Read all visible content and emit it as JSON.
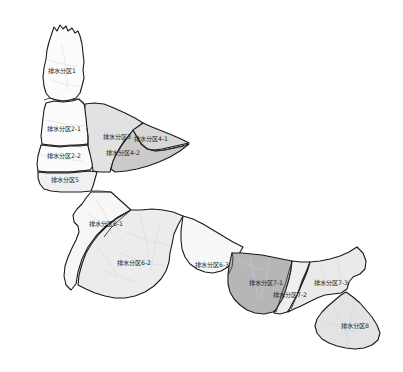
{
  "map": {
    "title": "排水分区划分图",
    "background_color": "#ffffff",
    "outline_color": "#1a1a1a",
    "street_color": "#cfcfcf",
    "label_color": "#1c1c1c",
    "zones": [
      {
        "id": "zone-1",
        "label": "排水分区1",
        "fill": "#fcfcfc",
        "label_x": 62,
        "label_y": 71,
        "path": "M 52 33 L 54 27 L 57 31 L 60 25 L 63 29 L 66 26 L 68 31 L 72 28 L 75 33 L 78 31 L 80 36 L 82 44 L 83 53 L 84 62 L 83 70 L 84 78 L 82 86 L 80 93 L 76 98 L 70 100 L 63 101 L 56 100 L 50 98 L 46 93 L 44 86 L 43 77 L 44 68 L 46 59 L 47 50 L 49 42 Z"
      },
      {
        "id": "zone-2-1",
        "label": "排水分区2-1",
        "fill": "#fbfbfb",
        "label_x": 64,
        "label_y": 129,
        "path": "M 46 103 L 54 101 L 63 102 L 72 101 L 79 99 L 84 104 L 86 111 L 87 120 L 88 129 L 89 138 L 88 144 L 78 145 L 68 146 L 58 146 L 48 145 L 42 144 L 41 136 L 42 127 L 43 118 L 44 110 Z"
      },
      {
        "id": "zone-2-2",
        "label": "排水分区2-2",
        "fill": "#fbfbfb",
        "label_x": 64,
        "label_y": 156,
        "path": "M 41 145 L 50 146 L 60 147 L 70 146 L 80 146 L 88 145 L 90 152 L 92 159 L 93 166 L 90 170 L 80 171 L 69 172 L 58 172 L 47 172 L 38 171 L 37 164 L 38 156 Z"
      },
      {
        "id": "zone-3",
        "label": "排水分区3",
        "fill": "#e2e2e2",
        "label_x": 117,
        "label_y": 137,
        "path": "M 85 104 L 94 103 L 104 104 L 114 108 L 125 113 L 135 118 L 143 123 L 137 128 L 130 134 L 124 141 L 119 149 L 115 157 L 112 165 L 110 172 L 100 172 L 93 171 L 92 163 L 90 154 L 88 146 L 88 137 L 87 128 L 86 118 L 85 110 Z"
      },
      {
        "id": "zone-4-1",
        "label": "排水分区4-1",
        "fill": "#d8d8d8",
        "label_x": 151,
        "label_y": 139,
        "path": "M 143 123 L 152 127 L 162 131 L 172 135 L 181 139 L 189 143 L 180 145 L 171 147 L 162 149 L 154 150 L 147 149 L 142 146 L 138 141 L 134 136 L 133 130 Z"
      },
      {
        "id": "zone-4-2",
        "label": "排水分区4-2",
        "fill": "#cacaca",
        "label_x": 123,
        "label_y": 153,
        "path": "M 133 130 L 137 137 L 141 144 L 147 149 L 155 151 L 164 150 L 173 148 L 182 146 L 189 144 L 180 151 L 170 157 L 159 162 L 148 166 L 137 169 L 126 171 L 115 172 L 111 169 L 113 161 L 117 153 L 122 145 L 128 137 Z"
      },
      {
        "id": "zone-5",
        "label": "排水分区5",
        "fill": "#f0f0f0",
        "label_x": 65,
        "label_y": 180,
        "path": "M 38 172 L 48 173 L 58 173 L 69 173 L 80 172 L 90 171 L 97 172 L 95 179 L 93 186 L 91 191 L 81 192 L 71 192 L 61 192 L 51 191 L 44 189 L 40 184 L 38 178 Z"
      },
      {
        "id": "zone-6-1",
        "label": "排水分区6-1",
        "fill": "#f7f7f7",
        "label_x": 106,
        "label_y": 224,
        "path": "M 91 192 L 101 192 L 111 192 L 121 201 L 131 210 L 118 217 L 106 226 L 96 236 L 88 247 L 82 259 L 78 272 L 76 284 L 71 290 L 66 285 L 64 276 L 65 266 L 68 257 L 72 248 L 76 240 L 79 232 L 78 226 L 74 222 L 73 215 L 77 209 L 82 204 L 86 198 Z"
      },
      {
        "id": "zone-6-2",
        "label": "排水分区6-2",
        "fill": "#ececec",
        "label_x": 134,
        "label_y": 263,
        "path": "M 131 210 L 141 210 L 152 209 L 163 210 L 173 212 L 183 216 L 178 225 L 174 234 L 172 244 L 170 253 L 169 262 L 166 271 L 161 279 L 154 286 L 145 292 L 135 296 L 125 298 L 115 298 L 105 296 L 95 293 L 86 289 L 78 285 L 79 275 L 82 264 L 86 253 L 92 243 L 99 234 L 107 226 L 116 219 Z"
      },
      {
        "id": "zone-6-3",
        "label": "排水分区6-3",
        "fill": "#f7f7f7",
        "label_x": 212,
        "label_y": 265,
        "path": "M 183 216 L 193 219 L 203 224 L 213 230 L 223 236 L 233 242 L 243 247 L 239 254 L 234 261 L 228 267 L 221 271 L 213 273 L 205 272 L 197 269 L 190 264 L 185 257 L 182 249 L 181 240 L 181 231 L 182 223 Z"
      },
      {
        "id": "zone-7-1",
        "label": "排水分区7-1",
        "fill": "#b6b6b6",
        "label_x": 266,
        "label_y": 283,
        "path": "M 232 253 L 242 253 L 252 254 L 262 255 L 272 257 L 282 259 L 292 261 L 291 270 L 289 280 L 287 290 L 284 299 L 280 307 L 273 312 L 264 314 L 255 313 L 247 310 L 240 305 L 234 299 L 230 292 L 228 284 L 228 275 L 229 266 Z"
      },
      {
        "id": "zone-7-2",
        "label": "排水分区7-2",
        "fill": "#efefef",
        "label_x": 290,
        "label_y": 295,
        "path": "M 292 261 L 301 262 L 310 262 L 306 272 L 302 281 L 299 290 L 296 299 L 292 307 L 287 312 L 280 314 L 274 313 L 278 306 L 283 298 L 286 289 L 289 279 L 291 270 Z"
      },
      {
        "id": "zone-7-3",
        "label": "排水分区7-3",
        "fill": "#eaeaea",
        "label_x": 331,
        "label_y": 283,
        "path": "M 310 262 L 320 261 L 330 259 L 340 256 L 349 252 L 357 247 L 363 253 L 366 261 L 365 269 L 360 274 L 353 277 L 349 282 L 347 289 L 341 293 L 333 294 L 325 295 L 317 298 L 309 302 L 301 306 L 294 309 L 288 312 L 292 304 L 297 295 L 301 286 L 305 277 L 308 269 Z"
      },
      {
        "id": "zone-8",
        "label": "排水分区8",
        "fill": "#e3e3e3",
        "label_x": 355,
        "label_y": 326,
        "path": "M 346 292 L 353 297 L 360 303 L 366 310 L 372 317 L 377 325 L 380 333 L 378 340 L 372 345 L 364 348 L 355 349 L 346 348 L 337 346 L 329 343 L 322 339 L 317 333 L 315 326 L 317 319 L 322 312 L 328 306 L 335 300 L 341 295 Z"
      }
    ],
    "inner_lines": [
      "M 44 100 L 50 98 L 57 100 L 64 101 L 71 100 L 78 99 L 84 103",
      "M 41 144 L 50 145 L 60 146 L 70 145 L 80 145 L 88 144",
      "M 37 171 L 47 172 L 58 172 L 69 172 L 80 171 L 90 170",
      "M 91 191 L 101 191 L 111 192",
      "M 87 128 L 88 137 L 88 146",
      "M 131 210 L 124 216 L 117 222 L 110 229 L 104 237",
      "M 292 261 L 289 271 L 286 282 L 282 293 L 279 303 L 276 312",
      "M 310 262 L 307 271 L 303 281 L 299 291 L 295 300 L 291 309",
      "M 133 130 L 137 137 L 142 144 L 148 149 L 156 151 L 165 150 L 175 148 L 184 146",
      "M 228 275 L 232 267 L 233 258 L 232 252"
    ],
    "streets": [
      "M 96 200 L 103 210 L 108 222 L 112 234",
      "M 88 214 L 98 220 L 109 225 L 120 229",
      "M 140 214 L 143 226 L 146 238 L 148 250 L 149 262",
      "M 125 232 L 136 236 L 148 240 L 160 243 L 171 246",
      "M 118 252 L 129 257 L 141 261 L 153 264 L 164 266",
      "M 104 270 L 115 275 L 127 279 L 139 282",
      "M 160 222 L 157 234 L 155 246 L 153 258 L 151 270",
      "M 96 246 L 104 255 L 111 265 L 117 275",
      "M 334 310 L 340 320 L 345 331 L 348 342",
      "M 326 322 L 337 326 L 348 330 L 359 333",
      "M 356 304 L 352 314 L 349 325 L 346 336",
      "M 61 44 L 64 55 L 66 67 L 67 79 L 67 90",
      "M 49 60 L 58 63 L 68 65 L 77 67",
      "M 50 80 L 60 83 L 70 85 L 79 86",
      "M 46 120 L 56 122 L 66 124 L 76 125 L 85 126",
      "M 40 155 L 50 157 L 61 159 L 72 160 L 83 161",
      "M 96 115 L 101 124 L 106 134 L 110 144 L 112 155",
      "M 117 110 L 124 117 L 131 125 L 137 133",
      "M 236 258 L 244 263 L 253 267 L 262 270",
      "M 250 256 L 252 266 L 254 277 L 256 288 L 258 299",
      "M 270 258 L 268 268 L 266 279 L 263 290 L 260 300",
      "M 318 262 L 322 271 L 327 281 L 331 290",
      "M 337 258 L 339 268 L 341 278 L 342 288"
    ]
  }
}
